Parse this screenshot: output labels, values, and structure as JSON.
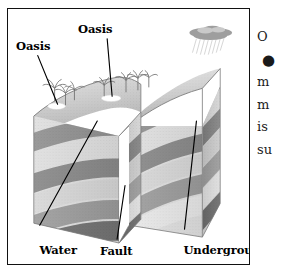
{
  "figure": {
    "kind": "geological-block-diagram",
    "style": "grayscale halftone illustration",
    "border_color": "#111111",
    "background_color": "#ffffff",
    "labels": [
      {
        "id": "oasis-left",
        "text": "Oasis",
        "lines": [
          "Oasis"
        ]
      },
      {
        "id": "oasis-top",
        "text": "Oasis",
        "lines": [
          "Oasis"
        ]
      },
      {
        "id": "water-table",
        "text": "Water table",
        "lines": [
          "Water",
          "table"
        ]
      },
      {
        "id": "fault",
        "text": "Fault",
        "lines": [
          "Fault"
        ]
      },
      {
        "id": "underground-water",
        "text": "Underground water",
        "lines": [
          "Underground",
          "water"
        ]
      }
    ],
    "scene_elements": [
      {
        "name": "rain-cloud",
        "description": "gray cloud with rain streaks over upper right ridge"
      },
      {
        "name": "palm-trees",
        "description": "cluster of palm trees on the desert surface"
      },
      {
        "name": "oasis-pool-left",
        "description": "small white water pool at left surface"
      },
      {
        "name": "oasis-pool-right",
        "description": "small white water pool at center surface"
      },
      {
        "name": "left-block",
        "description": "downthrown block of layered strata"
      },
      {
        "name": "right-block",
        "description": "upthrown block of layered strata, dipping"
      },
      {
        "name": "fault-gap",
        "description": "vertical break separating the two blocks"
      }
    ],
    "strata": [
      {
        "index": 0,
        "tone": "#b6b6b6",
        "role": "surface sand"
      },
      {
        "index": 1,
        "tone": "#8d8d8d",
        "role": "dark rock layer"
      },
      {
        "index": 2,
        "tone": "#dadada",
        "role": "light permeable layer"
      },
      {
        "index": 3,
        "tone": "#8a8a8a",
        "role": "dark rock layer"
      },
      {
        "index": 4,
        "tone": "#d2d2d2",
        "role": "light permeable layer"
      },
      {
        "index": 5,
        "tone": "#9a9a9a",
        "role": "dark rock layer"
      },
      {
        "index": 6,
        "tone": "#e0e0e0",
        "role": "aquifer / underground water"
      },
      {
        "index": 7,
        "tone": "#7e7e7e",
        "role": "basement rock"
      }
    ]
  },
  "body_text": {
    "note": "body text column clipped at the right edge of the screenshot",
    "lines": [
      "O",
      "",
      "m",
      "m",
      "is",
      "su"
    ],
    "bullet_glyph": "●"
  }
}
